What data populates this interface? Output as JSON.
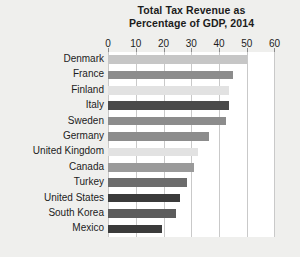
{
  "chart_data": {
    "type": "bar",
    "orientation": "horizontal",
    "title": "Total Tax Revenue as Percentage of GDP, 2014",
    "title_lines": [
      "Total Tax Revenue as",
      "Percentage of GDP, 2014"
    ],
    "xlabel": "",
    "ylabel": "",
    "xlim": [
      0,
      60
    ],
    "xticks": [
      0,
      10,
      20,
      30,
      40,
      50,
      60
    ],
    "xtick_labels": [
      "0",
      "10",
      "20",
      "30",
      "40",
      "50",
      "60"
    ],
    "grid": true,
    "grid_axis": "x",
    "legend": false,
    "categories": [
      "Denmark",
      "France",
      "Finland",
      "Italy",
      "Sweden",
      "Germany",
      "United Kingdom",
      "Canada",
      "Turkey",
      "United States",
      "South Korea",
      "Mexico"
    ],
    "values": [
      50.0,
      45.0,
      43.5,
      43.5,
      42.5,
      36.5,
      32.5,
      31.0,
      28.5,
      26.0,
      24.5,
      19.5
    ],
    "bar_colors": [
      "#c6c6c6",
      "#8c8c8c",
      "#e2e2e2",
      "#4a4a4a",
      "#8c8c8c",
      "#8c8c8c",
      "#e2e2e2",
      "#9a9a9a",
      "#6c6c6c",
      "#3b3b3b",
      "#5c5c5c",
      "#3b3b3b"
    ],
    "points": [
      {
        "category": "Denmark",
        "value": 50.0
      },
      {
        "category": "France",
        "value": 45.0
      },
      {
        "category": "Finland",
        "value": 43.5
      },
      {
        "category": "Italy",
        "value": 43.5
      },
      {
        "category": "Sweden",
        "value": 42.5
      },
      {
        "category": "Germany",
        "value": 36.5
      },
      {
        "category": "United Kingdom",
        "value": 32.5
      },
      {
        "category": "Canada",
        "value": 31.0
      },
      {
        "category": "Turkey",
        "value": 28.5
      },
      {
        "category": "United States",
        "value": 26.0
      },
      {
        "category": "South Korea",
        "value": 24.5
      },
      {
        "category": "Mexico",
        "value": 19.5
      }
    ]
  },
  "colors": {
    "page_background": "#efefed",
    "plot_background": "#ffffff",
    "gridline": "#c9c9c9",
    "text": "#1c1c1c"
  }
}
